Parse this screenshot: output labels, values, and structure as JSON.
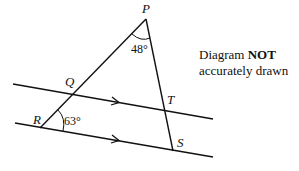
{
  "diagram": {
    "points": {
      "P": "P",
      "Q": "Q",
      "R": "R",
      "S": "S",
      "T": "T"
    },
    "angles": {
      "at_P": "48°",
      "at_R": "63°"
    },
    "note": {
      "prefix": "Diagram ",
      "bold": "NOT",
      "line2": "accurately drawn"
    },
    "line_color": "#111111"
  }
}
